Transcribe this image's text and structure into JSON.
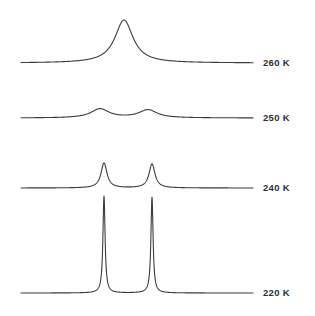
{
  "figure": {
    "background_color": "#ffffff",
    "trace_color": "#3b3b3b",
    "label_color": "#2e2e2e",
    "width": 315,
    "height": 316
  },
  "labels": {
    "t260": "260 K",
    "t250": "250 K",
    "t240": "240 K",
    "t220": "220 K"
  },
  "chart_data": {
    "type": "line",
    "xlabel": "",
    "ylabel": "",
    "xlim": [
      0,
      100
    ],
    "ylim": [
      0,
      1
    ],
    "grid": false,
    "legend": "right-side temperature annotations",
    "axis_visible": false,
    "plot_area_px": {
      "x_left": 21,
      "x_right": 253,
      "label_x": 263
    },
    "series": [
      {
        "name": "260 K",
        "label": "260 K",
        "baseline_y_px": 63,
        "trace_top_y_px": 20,
        "peaks": [
          {
            "center_x_px": 124,
            "center_x_units": 44.4,
            "height_px": 43,
            "half_width_px": 11.0,
            "shape": "lorentzian"
          }
        ],
        "description": "single coalesced peak, fully exchange-averaged"
      },
      {
        "name": "250 K",
        "label": "250 K",
        "baseline_y_px": 118,
        "trace_top_y_px": 109,
        "peaks": [
          {
            "center_x_px": 100,
            "center_x_units": 34.1,
            "height_px": 9,
            "half_width_px": 11.0,
            "shape": "lorentzian"
          },
          {
            "center_x_px": 148,
            "center_x_units": 54.7,
            "height_px": 8,
            "half_width_px": 11.0,
            "shape": "lorentzian"
          }
        ],
        "description": "two broad humps near coalescence"
      },
      {
        "name": "240 K",
        "label": "240 K",
        "baseline_y_px": 188,
        "trace_top_y_px": 163,
        "peaks": [
          {
            "center_x_px": 104,
            "center_x_units": 35.8,
            "height_px": 25,
            "half_width_px": 3.6,
            "shape": "lorentzian"
          },
          {
            "center_x_px": 152,
            "center_x_units": 56.5,
            "height_px": 24,
            "half_width_px": 3.6,
            "shape": "lorentzian"
          }
        ],
        "description": "two resolved broadened peaks"
      },
      {
        "name": "220 K",
        "label": "220 K",
        "baseline_y_px": 293,
        "trace_top_y_px": 196,
        "peaks": [
          {
            "center_x_px": 104,
            "center_x_units": 35.8,
            "height_px": 97,
            "half_width_px": 1.3,
            "shape": "lorentzian"
          },
          {
            "center_x_px": 152,
            "center_x_units": 56.5,
            "height_px": 96,
            "half_width_px": 1.3,
            "shape": "lorentzian"
          }
        ],
        "description": "two sharp slow-exchange peaks, tops extend off the stacked trace"
      }
    ]
  }
}
